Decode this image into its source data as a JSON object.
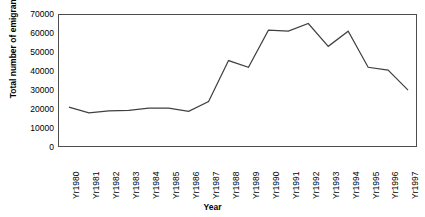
{
  "chart_data": {
    "type": "line",
    "title": "",
    "xlabel": "Year",
    "ylabel": "Total number of emigrants",
    "categories": [
      "Yr1980",
      "Yr1981",
      "Yr1982",
      "Yr1983",
      "Yr1984",
      "Yr1985",
      "Yr1986",
      "Yr1987",
      "Yr1988",
      "Yr1989",
      "Yr1990",
      "Yr1991",
      "Yr1992",
      "Yr1993",
      "Yr1994",
      "Yr1995",
      "Yr1996",
      "Yr1997"
    ],
    "values": [
      21500,
      18500,
      19500,
      19800,
      21000,
      21000,
      19300,
      24500,
      46000,
      42500,
      62000,
      61500,
      65500,
      53500,
      61500,
      42500,
      41000,
      30500
    ],
    "series": [
      {
        "name": "Total number of emigrants",
        "values": [
          21500,
          18500,
          19500,
          19800,
          21000,
          21000,
          19300,
          24500,
          46000,
          42500,
          62000,
          61500,
          65500,
          53500,
          61500,
          42500,
          41000,
          30500
        ]
      }
    ],
    "ylim": [
      0,
      70000
    ],
    "yticks": [
      0,
      10000,
      20000,
      30000,
      40000,
      50000,
      60000,
      70000
    ],
    "ytick_labels": [
      "0",
      "10000",
      "20000",
      "30000",
      "40000",
      "50000",
      "60000",
      "70000"
    ],
    "grid": false,
    "legend": false,
    "line_color": "#404040"
  }
}
